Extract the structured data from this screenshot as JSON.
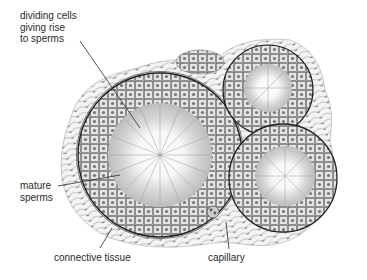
{
  "figure": {
    "labels": {
      "dividing_cells": "dividing cells\ngiving rise\nto sperms",
      "mature_sperms": "mature\nsperms",
      "connective_tissue": "connective tissue",
      "capillary": "capillary"
    },
    "colors": {
      "ink": "#2a2a2a",
      "cell_fill": "#d9d9d9",
      "background": "#ffffff"
    }
  }
}
